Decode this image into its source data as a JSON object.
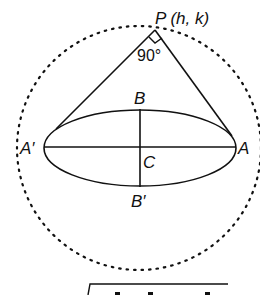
{
  "diagram": {
    "type": "ellipse-director-circle",
    "labels": {
      "point_p": "P (h, k)",
      "angle": "90°",
      "vertex_b": "B",
      "vertex_b_prime": "B′",
      "vertex_a": "A",
      "vertex_a_prime": "A′",
      "center_c": "C"
    },
    "colors": {
      "stroke": "#111111",
      "background": "#ffffff"
    }
  }
}
